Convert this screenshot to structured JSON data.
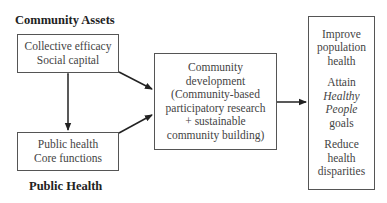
{
  "diagram": {
    "community_assets_label": "Community Assets",
    "public_health_label": "Public Health",
    "assets_box": {
      "lines": [
        "Collective efficacy",
        "Social capital"
      ]
    },
    "public_health_box": {
      "lines": [
        "Public health",
        "Core functions"
      ]
    },
    "community_development_box": {
      "lines": [
        "Community",
        "development",
        "(Community-based",
        "participatory research",
        "+ sustainable",
        "community building)"
      ]
    },
    "outcomes_box": {
      "groups": [
        {
          "lines": [
            "Improve",
            "population",
            "health"
          ]
        },
        {
          "lines": [
            "Attain",
            "Healthy",
            "People",
            "goals"
          ]
        },
        {
          "lines": [
            "Reduce",
            "health",
            "disparities"
          ]
        }
      ]
    },
    "arrows": [
      {
        "from": "assets_box",
        "to": "public_health_box",
        "type": "bidirectional"
      },
      {
        "from": "assets_box",
        "to": "community_development_box",
        "type": "directed"
      },
      {
        "from": "public_health_box",
        "to": "community_development_box",
        "type": "directed"
      },
      {
        "from": "community_development_box",
        "to": "outcomes_box",
        "type": "directed"
      }
    ],
    "colors": {
      "line": "#333333",
      "text": "#444444",
      "label": "#222222"
    }
  }
}
